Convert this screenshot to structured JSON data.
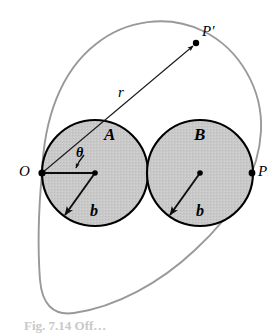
{
  "figure": {
    "background_color": "#ffffff"
  },
  "colors": {
    "circle_fill": "#c8c8c8",
    "circle_stroke": "#000000",
    "cardioid_stroke": "#999999",
    "ray_stroke": "#1a1a1a",
    "point_fill": "#000000",
    "caption_text": "#c9c9c9"
  },
  "labels": {
    "circle_a": "A",
    "circle_b": "B",
    "origin": "O",
    "point_p": "P",
    "point_p_prime": "P′",
    "radius_r": "r",
    "angle_theta": "θ",
    "radius_b_left": "b",
    "radius_b_right": "b"
  },
  "caption": {
    "text": "Fig. 7.14  Off…"
  },
  "geometry": {
    "origin_point": {
      "x": 42,
      "y": 173
    },
    "circle_a": {
      "cx": 95,
      "cy": 173,
      "r": 53
    },
    "circle_b": {
      "cx": 200,
      "cy": 173,
      "r": 53
    },
    "tangency_point": {
      "x": 147,
      "y": 173
    },
    "point_p": {
      "x": 252,
      "y": 173
    },
    "point_p_prime": {
      "x": 196,
      "y": 43
    },
    "cardioid": {
      "cusp": {
        "x": 42,
        "y": 173
      },
      "max_x": 262,
      "equation": "r = a(1 + cosθ)",
      "a": 105
    },
    "angle_theta_degrees": 45,
    "reference_line": {
      "from_x": 42,
      "to_x": 96,
      "y": 173
    }
  }
}
